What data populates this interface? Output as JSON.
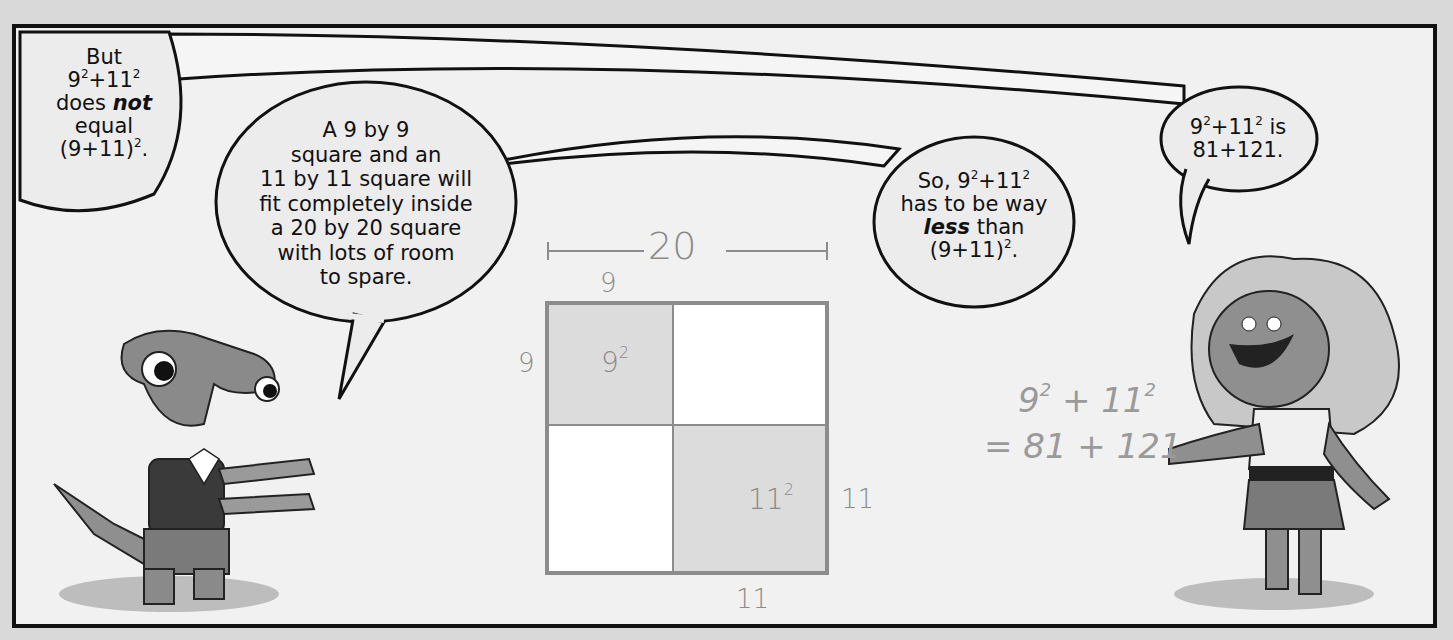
{
  "comic": {
    "bubbles": [
      {
        "id": "shark",
        "lines": [
          "But",
          "9²+11²",
          "does not",
          "equal",
          "(9+11)²."
        ],
        "emphasis": "not"
      },
      {
        "id": "shark-explain",
        "lines": [
          "A 9 by 9",
          "square and an",
          "11 by 11 square will",
          "fit completely inside",
          "a 20 by 20 square",
          "with lots of room",
          "to spare."
        ]
      },
      {
        "id": "conclusion",
        "lines": [
          "So, 9²+11²",
          "has to be way",
          "less than",
          "(9+11)²."
        ],
        "emphasis": "less"
      },
      {
        "id": "girl",
        "lines": [
          "9²+11² is",
          "81+121."
        ]
      }
    ],
    "diagram": {
      "top_span_label": "20",
      "top_left_label": "9",
      "left_label": "9",
      "right_label": "11",
      "bottom_label": "11",
      "small_square_label": "9",
      "small_square_exp": "2",
      "large_square_label": "11",
      "large_square_exp": "2",
      "shaded_color": "#dcdcdc",
      "stroke_color": "#8c8c8c"
    },
    "handwritten": {
      "line1_a": "9",
      "line1_a_exp": "2",
      "line1_plus": "+",
      "line1_b": "11",
      "line1_b_exp": "2",
      "line2": "= 81 + 121"
    },
    "characters": [
      "hammerhead-shark-boy",
      "girl-with-big-hair"
    ]
  }
}
